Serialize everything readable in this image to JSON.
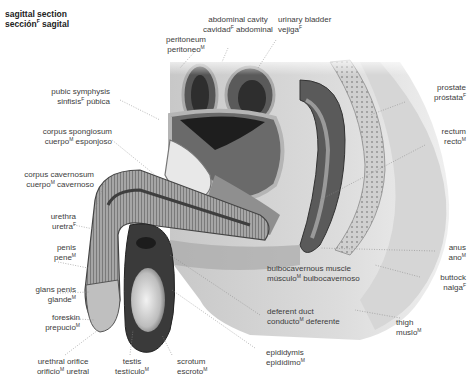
{
  "title": {
    "en": "sagittal section",
    "es": "sección",
    "es_gender": "F",
    "es_rest": " sagital"
  },
  "labels": [
    {
      "id": "peritoneum",
      "en": "peritoneum",
      "es": "peritoneo",
      "gender": "M",
      "es_rest": ""
    },
    {
      "id": "abdominal-cavity",
      "en": "abdominal cavity",
      "es": "cavidad",
      "gender": "F",
      "es_rest": " abdominal"
    },
    {
      "id": "urinary-bladder",
      "en": "urinary bladder",
      "es": "vejiga",
      "gender": "F",
      "es_rest": ""
    },
    {
      "id": "pubic-symphysis",
      "en": "pubic symphysis",
      "es": "sinfisis",
      "gender": "F",
      "es_rest": " púbica"
    },
    {
      "id": "prostate",
      "en": "prostate",
      "es": "próstata",
      "gender": "F",
      "es_rest": ""
    },
    {
      "id": "corpus-spongiosum",
      "en": "corpus spongiosum",
      "es": "cuerpo",
      "gender": "M",
      "es_rest": " esponjoso"
    },
    {
      "id": "rectum",
      "en": "rectum",
      "es": "recto",
      "gender": "M",
      "es_rest": ""
    },
    {
      "id": "corpus-cavernosum",
      "en": "corpus cavernosum",
      "es": "cuerpo",
      "gender": "M",
      "es_rest": " cavernoso"
    },
    {
      "id": "urethra",
      "en": "urethra",
      "es": "uretra",
      "gender": "F",
      "es_rest": ""
    },
    {
      "id": "penis",
      "en": "penis",
      "es": "pene",
      "gender": "M",
      "es_rest": ""
    },
    {
      "id": "anus",
      "en": "anus",
      "es": "ano",
      "gender": "M",
      "es_rest": ""
    },
    {
      "id": "bulbocavernous-muscle",
      "en": "bulbocavernous muscle",
      "es": "músculo",
      "gender": "M",
      "es_rest": " bulbocavernoso"
    },
    {
      "id": "buttock",
      "en": "buttock",
      "es": "nalga",
      "gender": "F",
      "es_rest": ""
    },
    {
      "id": "glans-penis",
      "en": "glans penis",
      "es": "glande",
      "gender": "M",
      "es_rest": ""
    },
    {
      "id": "deferent-duct",
      "en": "deferent duct",
      "es": "conducto",
      "gender": "M",
      "es_rest": " deferente"
    },
    {
      "id": "foreskin",
      "en": "foreskin",
      "es": "prepucio",
      "gender": "M",
      "es_rest": ""
    },
    {
      "id": "thigh",
      "en": "thigh",
      "es": "muslo",
      "gender": "M",
      "es_rest": ""
    },
    {
      "id": "urethral-orifice",
      "en": "urethral orifice",
      "es": "orificio",
      "gender": "M",
      "es_rest": " uretral"
    },
    {
      "id": "testis",
      "en": "testis",
      "es": "testículo",
      "gender": "M",
      "es_rest": ""
    },
    {
      "id": "scrotum",
      "en": "scrotum",
      "es": "escroto",
      "gender": "M",
      "es_rest": ""
    },
    {
      "id": "epididymis",
      "en": "epididymis",
      "es": "epidídimo",
      "gender": "M",
      "es_rest": ""
    }
  ],
  "colors": {
    "text": "#3c3c3c",
    "skin": "#d9d9d9",
    "tissue_dark": "#4a4a4a",
    "tissue_mid": "#9a9a9a",
    "leader": "#8a8a8a"
  }
}
